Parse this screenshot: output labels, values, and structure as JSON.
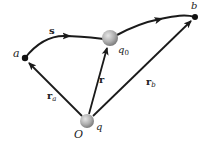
{
  "diagram": {
    "type": "physics-vector-diagram",
    "points": {
      "a": {
        "label": "a"
      },
      "b": {
        "label": "b"
      },
      "origin": {
        "label": "O"
      }
    },
    "charges": {
      "source": {
        "label": "q"
      },
      "test": {
        "label": "q",
        "subscript": "0"
      }
    },
    "vectors": {
      "r": {
        "label": "r"
      },
      "r_a": {
        "label": "r",
        "subscript": "a"
      },
      "r_b": {
        "label": "r",
        "subscript": "b"
      }
    },
    "path": {
      "label": "s"
    },
    "colors": {
      "line": "#1a1a1a",
      "sphere_light": "#d8d8d8",
      "sphere_dark": "#8a8a8a"
    }
  }
}
